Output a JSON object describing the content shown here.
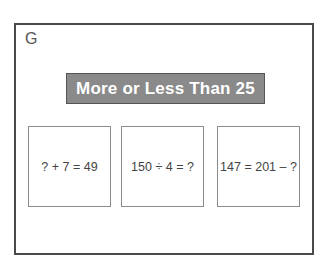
{
  "panel": {
    "letter": "G"
  },
  "banner": {
    "title": "More or Less Than 25",
    "background_color": "#8a8a8a",
    "text_color": "#ffffff"
  },
  "cards": [
    {
      "expression": "? + 7 = 49"
    },
    {
      "expression": "150 ÷ 4 = ?"
    },
    {
      "expression": "147 = 201 – ?"
    }
  ]
}
